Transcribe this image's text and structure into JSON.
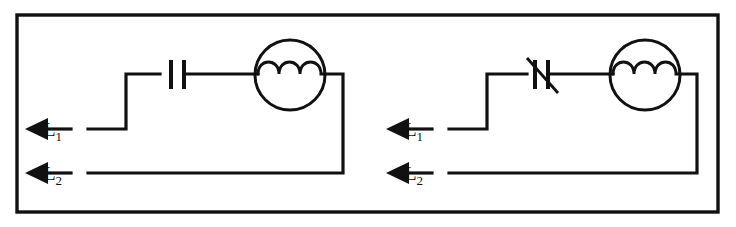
{
  "figure": {
    "kind": "electrical-schematic",
    "stroke_color": "#111111",
    "background_color": "#ffffff",
    "border": {
      "x": 17,
      "y": 15,
      "width": 701,
      "height": 197
    }
  },
  "circuits": [
    {
      "id": "left-circuit",
      "name": "fixed-capacitor-motor-circuit",
      "capacitor": {
        "type": "fixed",
        "symbol_name": "capacitor-symbol",
        "variable": false
      },
      "device": {
        "type": "motor-coil",
        "symbol_name": "motor-circle-coil",
        "coil_bumps": 3,
        "circle_cx": 290,
        "circle_cy": 75,
        "circle_r": 35
      },
      "terminals": [
        {
          "id": "l1",
          "label_main": "L",
          "label_sub": "1",
          "name": "terminal-l1",
          "y": 129
        },
        {
          "id": "l2",
          "label_main": "L",
          "label_sub": "2",
          "name": "terminal-l2",
          "y": 173
        }
      ],
      "geometry": {
        "riser_x": 126,
        "top_rail_y": 74,
        "return_x": 343,
        "arrow_tip_x": 25,
        "label_x": 57,
        "lead_start_x": 71
      }
    },
    {
      "id": "right-circuit",
      "name": "variable-capacitor-motor-circuit",
      "capacitor": {
        "type": "variable",
        "symbol_name": "variable-capacitor-symbol",
        "variable": true
      },
      "device": {
        "type": "motor-coil",
        "symbol_name": "motor-circle-coil",
        "coil_bumps": 3,
        "circle_cx": 645,
        "circle_cy": 75,
        "circle_r": 35
      },
      "terminals": [
        {
          "id": "l1",
          "label_main": "L",
          "label_sub": "1",
          "name": "terminal-l1",
          "y": 129
        },
        {
          "id": "l2",
          "label_main": "L",
          "label_sub": "2",
          "name": "terminal-l2",
          "y": 173
        }
      ],
      "geometry": {
        "riser_x": 487,
        "top_rail_y": 74,
        "return_x": 697,
        "arrow_tip_x": 386,
        "label_x": 418,
        "lead_start_x": 432
      }
    }
  ]
}
